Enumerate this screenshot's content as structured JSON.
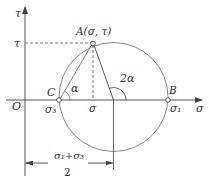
{
  "figure": {
    "colors": {
      "line": "#555555",
      "circle": "#8a8a8a",
      "text": "#333333",
      "background": "#ffffff"
    },
    "axes": {
      "x_label": "σ",
      "y_label": "τ",
      "origin_label": "O",
      "y_tick_label": "τ"
    },
    "points": {
      "A": {
        "label": "A(σ, τ)"
      },
      "B": {
        "label": "B",
        "value_label": "σ₁"
      },
      "C": {
        "label": "C",
        "value_label": "σ₃"
      },
      "sigma_foot": {
        "label": "σ"
      }
    },
    "angles": {
      "alpha": "α",
      "two_alpha": "2α"
    },
    "dimension": {
      "numerator": "σ₁+σ₃",
      "denominator": "2"
    }
  }
}
